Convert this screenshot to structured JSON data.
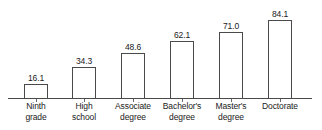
{
  "chart_data": {
    "type": "bar",
    "title": "",
    "subtitle": "",
    "xlabel": "",
    "ylabel": "",
    "ylim": [
      0,
      84.1
    ],
    "grid": false,
    "legend": "none",
    "axis": {
      "baseline_visible": true,
      "ticks_visible": true,
      "y_axis_visible": false
    },
    "categories": [
      "Ninth grade",
      "High school",
      "Associate degree",
      "Bachelor's degree",
      "Master's degree",
      "Doctorate"
    ],
    "values": [
      16.1,
      34.3,
      48.6,
      62.1,
      71.0,
      84.1
    ],
    "value_labels": [
      "16.1",
      "34.3",
      "48.6",
      "62.1",
      "71.0",
      "84.1"
    ],
    "category_label_lines": [
      [
        "Ninth",
        "grade"
      ],
      [
        "High",
        "school"
      ],
      [
        "Associate",
        "degree"
      ],
      [
        "Bachelor's",
        "degree"
      ],
      [
        "Master's",
        "degree"
      ],
      [
        "Doctorate",
        ""
      ]
    ],
    "colors": {
      "bar_fill": "#ffffff",
      "bar_stroke": "#4a4a4a",
      "axis": "#4a4a4a",
      "tick": "#6b6b6b",
      "text": "#1a1a1a",
      "background": "#ffffff"
    }
  }
}
